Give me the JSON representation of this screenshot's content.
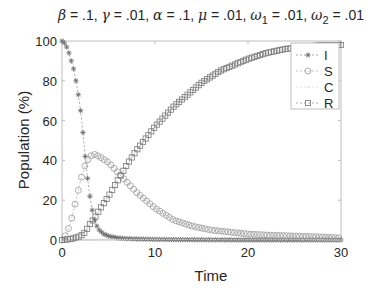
{
  "chart_data": {
    "type": "line",
    "title": "β = .1, γ = .01, α = .1, μ = .01, ω1 = .01, ω2 = .01",
    "title_parts": [
      {
        "sym": "β",
        "val": " = .1, "
      },
      {
        "sym": "γ",
        "val": " = .01, "
      },
      {
        "sym": "α",
        "val": " = .1, "
      },
      {
        "sym": "μ",
        "val": " = .01, "
      },
      {
        "sym": "ω",
        "sub": "1",
        "val": " = .01, "
      },
      {
        "sym": "ω",
        "sub": "2",
        "val": " = .01"
      }
    ],
    "xlabel": "Time",
    "ylabel": "Population (%)",
    "xlim": [
      0,
      30
    ],
    "ylim": [
      0,
      100
    ],
    "xticks": [
      0,
      10,
      20,
      30
    ],
    "yticks": [
      0,
      20,
      40,
      60,
      80,
      100
    ],
    "grid": false,
    "legend_position": "upper right",
    "series": [
      {
        "name": "I",
        "marker": "asterisk",
        "color": "#6e6e6e",
        "x": [
          0,
          0.25,
          0.5,
          0.75,
          1,
          1.25,
          1.5,
          1.75,
          2,
          2.25,
          2.5,
          2.75,
          3,
          3.25,
          3.5,
          3.75,
          4,
          4.5,
          5,
          6,
          7,
          8,
          10,
          12,
          15,
          20,
          25,
          30
        ],
        "values": [
          100,
          99,
          97,
          94,
          90,
          86,
          80,
          73,
          65,
          54,
          42,
          31,
          22,
          15,
          10,
          7,
          5,
          3,
          2,
          1,
          0.7,
          0.5,
          0.3,
          0.2,
          0.1,
          0,
          0,
          0
        ]
      },
      {
        "name": "S",
        "marker": "circle",
        "color": "#9a9a9a",
        "x": [
          0,
          0.5,
          1,
          1.5,
          2,
          2.5,
          3,
          3.5,
          4,
          5,
          6,
          7,
          8,
          9,
          10,
          12,
          14,
          16,
          18,
          20,
          22,
          25,
          28,
          30
        ],
        "values": [
          0,
          3,
          10,
          20,
          30,
          38,
          42,
          43,
          42,
          39,
          34,
          29,
          24,
          20,
          16,
          10,
          7,
          5,
          4,
          3,
          2.5,
          2,
          1.5,
          1
        ]
      },
      {
        "name": "C",
        "marker": "dot",
        "color": "#d0d0d0",
        "x": [
          0,
          5,
          10,
          15,
          20,
          25,
          30
        ],
        "values": [
          0,
          0.3,
          0.3,
          0.2,
          0.1,
          0.1,
          0
        ]
      },
      {
        "name": "R",
        "marker": "square",
        "color": "#7a7a7a",
        "x": [
          0,
          1,
          2,
          2.5,
          3,
          3.5,
          4,
          5,
          6,
          7,
          8,
          9,
          10,
          11,
          12,
          13,
          14,
          15,
          16,
          17,
          18,
          19,
          20,
          21,
          22,
          23,
          24,
          25,
          26,
          27,
          28,
          29,
          30
        ],
        "values": [
          0,
          0.5,
          2,
          4,
          8,
          11,
          15,
          22,
          30,
          38,
          45,
          51,
          57,
          62,
          67,
          71,
          75,
          79,
          82,
          85,
          87,
          89,
          91,
          92.5,
          94,
          95,
          96,
          96.5,
          97,
          97.5,
          98,
          98,
          98
        ]
      }
    ]
  },
  "legend": {
    "items": [
      {
        "label": "I"
      },
      {
        "label": "S"
      },
      {
        "label": "C"
      },
      {
        "label": "R"
      }
    ]
  },
  "axes": {
    "xlabel": "Time",
    "ylabel": "Population (%)",
    "xtick_labels": [
      "0",
      "10",
      "20",
      "30"
    ],
    "ytick_labels": [
      "0",
      "20",
      "40",
      "60",
      "80",
      "100"
    ]
  }
}
